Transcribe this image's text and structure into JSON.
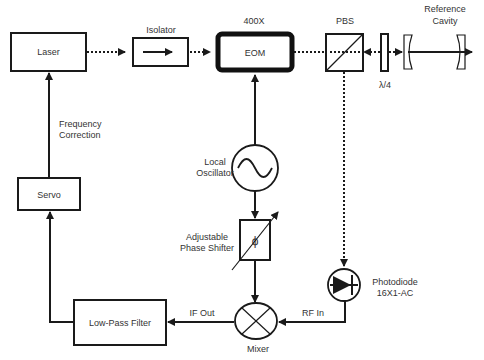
{
  "diagram": {
    "components": {
      "laser": {
        "label": "Laser"
      },
      "isolator": {
        "label": "Isolator"
      },
      "eom": {
        "label": "EOM",
        "model": "400X"
      },
      "pbs": {
        "label": "PBS"
      },
      "quarter_wave": {
        "label": "λ/4"
      },
      "reference_cavity": {
        "label_line1": "Reference",
        "label_line2": "Cavity"
      },
      "local_oscillator": {
        "label_line1": "Local",
        "label_line2": "Oscillator"
      },
      "phase_shifter": {
        "label_line1": "Adjustable",
        "label_line2": "Phase Shifter",
        "symbol": "ϕ"
      },
      "photodiode": {
        "label_line1": "Photodiode",
        "label_line2": "16X1-AC"
      },
      "mixer": {
        "label": "Mixer"
      },
      "low_pass_filter": {
        "label": "Low-Pass Filter"
      },
      "servo": {
        "label": "Servo"
      }
    },
    "signals": {
      "frequency_correction_line1": "Frequency",
      "frequency_correction_line2": "Correction",
      "if_out": "IF Out",
      "rf_in": "RF In"
    },
    "colors": {
      "stroke": "#1a1a1a",
      "text": "#333333",
      "background": "#ffffff"
    }
  }
}
